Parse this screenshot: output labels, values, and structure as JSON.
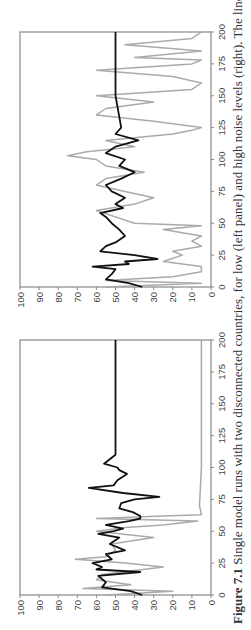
{
  "caption": {
    "label": "Figure 7.1",
    "text": "Single model runs with two disconnected countries, for low (left panel) and high noise levels (right). The lines"
  },
  "colors": {
    "country_a": "#111111",
    "country_b": "#aaaaaa",
    "axis": "#888888"
  },
  "chart_data": [
    {
      "type": "line",
      "panel": "left",
      "title": "Low noise",
      "xlabel": "",
      "ylabel": "",
      "xlim": [
        0,
        200
      ],
      "ylim": [
        0,
        100
      ],
      "x_ticks": [
        0,
        25,
        50,
        75,
        100,
        125,
        150,
        175,
        200
      ],
      "y_ticks": [
        0,
        10,
        20,
        30,
        40,
        50,
        60,
        70,
        80,
        90,
        100
      ],
      "grid": false,
      "legend": null,
      "series": [
        {
          "name": "Country A (black)",
          "x": [
            0,
            3,
            6,
            10,
            15,
            18,
            20,
            22,
            25,
            28,
            32,
            35,
            40,
            45,
            48,
            50,
            52,
            55,
            58,
            60,
            62,
            65,
            68,
            72,
            75,
            77,
            80,
            84,
            86,
            90,
            95,
            98,
            100,
            103,
            110,
            125,
            150,
            175,
            200
          ],
          "y": [
            36,
            42,
            57,
            55,
            59,
            37,
            60,
            57,
            62,
            52,
            55,
            45,
            53,
            48,
            59,
            51,
            46,
            55,
            43,
            37,
            37,
            41,
            48,
            47,
            40,
            27,
            46,
            64,
            51,
            49,
            44,
            48,
            49,
            56,
            50,
            50,
            50,
            50,
            50
          ]
        },
        {
          "name": "Country B (grey)",
          "x": [
            0,
            3,
            5,
            8,
            12,
            16,
            22,
            25,
            28,
            30,
            35,
            40,
            45,
            50,
            53,
            55,
            58,
            60,
            62,
            63,
            70,
            100,
            125,
            150,
            175,
            200
          ],
          "y": [
            55,
            20,
            67,
            42,
            60,
            57,
            25,
            45,
            71,
            55,
            50,
            52,
            30,
            60,
            45,
            25,
            7,
            60,
            25,
            5,
            6,
            5,
            5,
            5,
            5,
            5
          ]
        }
      ]
    },
    {
      "type": "line",
      "panel": "right",
      "title": "High noise",
      "xlabel": "",
      "ylabel": "",
      "xlim": [
        0,
        200
      ],
      "ylim": [
        0,
        100
      ],
      "x_ticks": [
        0,
        25,
        50,
        75,
        100,
        125,
        150,
        175,
        200
      ],
      "y_ticks": [
        0,
        10,
        20,
        30,
        40,
        50,
        60,
        70,
        80,
        90,
        100
      ],
      "grid": false,
      "legend": null,
      "series": [
        {
          "name": "Country A (black)",
          "x": [
            0,
            3,
            6,
            10,
            14,
            16,
            18,
            20,
            22,
            25,
            28,
            32,
            35,
            40,
            45,
            50,
            55,
            58,
            62,
            65,
            70,
            75,
            80,
            85,
            90,
            95,
            100,
            105,
            110,
            115,
            120,
            125,
            150,
            175,
            200
          ],
          "y": [
            36,
            43,
            55,
            52,
            50,
            62,
            43,
            45,
            28,
            40,
            58,
            55,
            50,
            45,
            48,
            52,
            55,
            58,
            46,
            50,
            45,
            52,
            55,
            47,
            40,
            48,
            45,
            55,
            50,
            38,
            50,
            47,
            50,
            50,
            50
          ]
        },
        {
          "name": "Country B (grey)",
          "x": [
            0,
            3,
            5,
            8,
            12,
            16,
            20,
            25,
            28,
            32,
            36,
            40,
            45,
            48,
            50,
            55,
            60,
            65,
            70,
            75,
            80,
            85,
            90,
            95,
            100,
            103,
            106,
            110,
            115,
            120,
            123,
            125,
            130,
            135,
            140,
            145,
            150,
            155,
            160,
            165,
            170,
            175,
            178,
            180,
            185,
            190,
            195,
            200
          ],
          "y": [
            55,
            5,
            55,
            20,
            5,
            5,
            25,
            15,
            20,
            5,
            10,
            5,
            25,
            5,
            40,
            50,
            60,
            40,
            30,
            45,
            60,
            55,
            35,
            55,
            60,
            75,
            65,
            40,
            55,
            20,
            10,
            5,
            30,
            60,
            55,
            30,
            60,
            10,
            5,
            20,
            60,
            10,
            5,
            40,
            5,
            45,
            10,
            5
          ]
        }
      ]
    }
  ]
}
